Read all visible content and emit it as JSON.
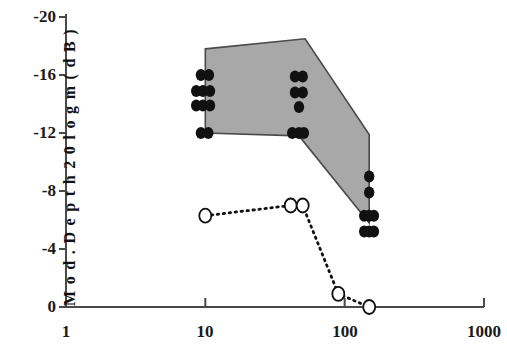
{
  "chart_data": {
    "type": "scatter",
    "title": "",
    "xlabel": "",
    "ylabel": "Mod. Depth 20 logm (dB)",
    "xscale": "log",
    "xlim": [
      1,
      1000
    ],
    "ylim": [
      0,
      -20
    ],
    "x_ticks": [
      1,
      10,
      100,
      1000
    ],
    "x_tick_labels": [
      "1",
      "10",
      "100",
      "1000"
    ],
    "y_ticks": [
      -20,
      -16,
      -12,
      -8,
      -4,
      0
    ],
    "y_tick_labels": [
      "-20",
      "-16",
      "-12",
      "-8",
      "-4",
      "0"
    ],
    "grid": false,
    "legend": "none",
    "series": [
      {
        "name": "filled-circle-measurements",
        "marker": "filled-circle",
        "color": "#111111",
        "points": [
          {
            "x": 9.3,
            "y": -16.0
          },
          {
            "x": 10.6,
            "y": -16.0
          },
          {
            "x": 8.6,
            "y": -14.9
          },
          {
            "x": 9.6,
            "y": -14.9
          },
          {
            "x": 10.8,
            "y": -14.9
          },
          {
            "x": 8.6,
            "y": -13.9
          },
          {
            "x": 9.6,
            "y": -13.9
          },
          {
            "x": 10.8,
            "y": -13.9
          },
          {
            "x": 9.3,
            "y": -12.0
          },
          {
            "x": 10.5,
            "y": -12.0
          },
          {
            "x": 44.0,
            "y": -15.9
          },
          {
            "x": 50.0,
            "y": -15.9
          },
          {
            "x": 44.0,
            "y": -14.8
          },
          {
            "x": 50.0,
            "y": -14.8
          },
          {
            "x": 47.0,
            "y": -13.8
          },
          {
            "x": 42.0,
            "y": -12.0
          },
          {
            "x": 47.0,
            "y": -12.0
          },
          {
            "x": 51.0,
            "y": -12.0
          },
          {
            "x": 150.0,
            "y": -9.0
          },
          {
            "x": 150.0,
            "y": -7.9
          },
          {
            "x": 138.0,
            "y": -6.3
          },
          {
            "x": 150.0,
            "y": -6.3
          },
          {
            "x": 162.0,
            "y": -6.3
          },
          {
            "x": 138.0,
            "y": -5.2
          },
          {
            "x": 150.0,
            "y": -5.2
          },
          {
            "x": 162.0,
            "y": -5.2
          }
        ]
      },
      {
        "name": "open-circle-dotted-series",
        "marker": "open-circle",
        "line": "dotted",
        "color": "#111111",
        "points": [
          {
            "x": 10.0,
            "y": -6.3
          },
          {
            "x": 41.0,
            "y": -7.0
          },
          {
            "x": 50.0,
            "y": -7.0
          },
          {
            "x": 90.0,
            "y": -0.9
          },
          {
            "x": 150.0,
            "y": 0.0
          }
        ]
      }
    ],
    "shaded_region": {
      "name": "shaded-range-polygon",
      "fill": "#a8a8a8",
      "stroke": "#4a4a4a",
      "vertices": [
        {
          "x": 10.0,
          "y": -17.8
        },
        {
          "x": 52.0,
          "y": -18.5
        },
        {
          "x": 150.0,
          "y": -11.9
        },
        {
          "x": 150.0,
          "y": -5.8
        },
        {
          "x": 47.0,
          "y": -11.8
        },
        {
          "x": 10.0,
          "y": -12.0
        }
      ]
    }
  },
  "axes": {
    "y_title": "M o d . D e p t h  2 0 l o g m ( d B )",
    "y_labels": [
      "-20",
      "-16",
      "-12",
      "-8",
      "-4",
      "0"
    ],
    "x_labels": [
      "1",
      "10",
      "100",
      "1000"
    ]
  }
}
